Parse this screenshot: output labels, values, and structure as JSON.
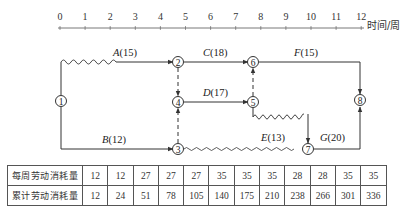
{
  "axis": {
    "ticks": [
      "0",
      "1",
      "2",
      "3",
      "4",
      "5",
      "6",
      "7",
      "8",
      "9",
      "10",
      "11",
      "12"
    ],
    "unit_label": "时间/周"
  },
  "nodes": [
    {
      "id": "1",
      "label": "1"
    },
    {
      "id": "2",
      "label": "2"
    },
    {
      "id": "3",
      "label": "3"
    },
    {
      "id": "4",
      "label": "4"
    },
    {
      "id": "5",
      "label": "5"
    },
    {
      "id": "6",
      "label": "6"
    },
    {
      "id": "7",
      "label": "7"
    },
    {
      "id": "8",
      "label": "8"
    }
  ],
  "activities": [
    {
      "name": "A",
      "duration": "(15)",
      "from": "1",
      "to": "2"
    },
    {
      "name": "B",
      "duration": "(12)",
      "from": "1",
      "to": "3"
    },
    {
      "name": "C",
      "duration": "(18)",
      "from": "2",
      "to": "6"
    },
    {
      "name": "D",
      "duration": "(17)",
      "from": "4",
      "to": "5"
    },
    {
      "name": "E",
      "duration": "(13)",
      "from": "5",
      "to": "7"
    },
    {
      "name": "F",
      "duration": "(15)",
      "from": "6",
      "to": "8"
    },
    {
      "name": "G",
      "duration": "(20)",
      "from": "7",
      "to": "8"
    }
  ],
  "dummies": [
    {
      "from": "2",
      "to": "4"
    },
    {
      "from": "3",
      "to": "4"
    },
    {
      "from": "5",
      "to": "6"
    }
  ],
  "table": {
    "rows": [
      {
        "label": "每周劳动消耗量",
        "values": [
          "12",
          "12",
          "27",
          "27",
          "27",
          "35",
          "35",
          "35",
          "28",
          "28",
          "35",
          "35"
        ]
      },
      {
        "label": "累计劳动消耗量",
        "values": [
          "12",
          "24",
          "51",
          "78",
          "105",
          "140",
          "175",
          "210",
          "238",
          "266",
          "301",
          "336"
        ]
      }
    ]
  }
}
